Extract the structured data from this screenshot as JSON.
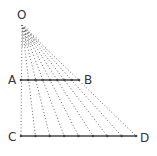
{
  "diagram": {
    "labels": {
      "O": "O",
      "A": "A",
      "B": "B",
      "C": "C",
      "D": "D"
    },
    "colors": {
      "line": "#444444",
      "ray": "#555555",
      "text": "#333333",
      "background": "#ffffff"
    },
    "apex": {
      "x": 22,
      "y": 22
    },
    "label_positions": {
      "O": {
        "x": 17,
        "y": 19
      },
      "A": {
        "x": 8,
        "y": 84
      },
      "B": {
        "x": 84,
        "y": 84
      },
      "C": {
        "x": 8,
        "y": 141
      },
      "D": {
        "x": 140,
        "y": 142
      }
    },
    "segment_AB": {
      "x1": 21,
      "y": 80,
      "x2": 79
    },
    "segment_CD": {
      "x1": 21,
      "y": 136,
      "x2": 136
    },
    "division_count": 8
  }
}
